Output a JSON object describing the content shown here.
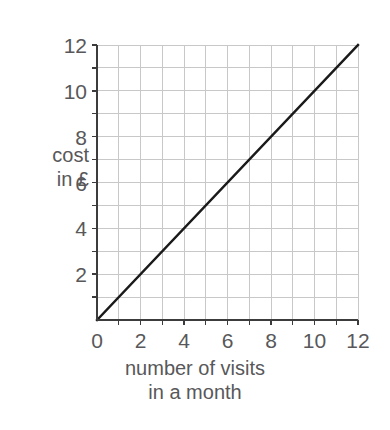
{
  "chart_data": {
    "type": "line",
    "title": "",
    "xlabel": "number of visits\nin a month",
    "ylabel": "cost\nin £",
    "xlim": [
      0,
      12
    ],
    "ylim": [
      0,
      12
    ],
    "grid": true,
    "grid_step": 1,
    "legend": "none",
    "x_tick_labels": [
      "0",
      "2",
      "4",
      "6",
      "8",
      "10",
      "12"
    ],
    "x_tick_values": [
      0,
      2,
      4,
      6,
      8,
      10,
      12
    ],
    "y_tick_labels": [
      "2",
      "4",
      "6",
      "8",
      "10",
      "12"
    ],
    "y_tick_values": [
      2,
      4,
      6,
      8,
      10,
      12
    ],
    "series": [
      {
        "name": "cost",
        "x": [
          0,
          12
        ],
        "values": [
          0,
          12
        ],
        "points": [
          [
            0,
            0
          ],
          [
            1,
            1
          ],
          [
            2,
            2
          ],
          [
            3,
            3
          ],
          [
            4,
            4
          ],
          [
            5,
            5
          ],
          [
            6,
            6
          ],
          [
            7,
            7
          ],
          [
            8,
            8
          ],
          [
            9,
            9
          ],
          [
            10,
            10
          ],
          [
            11,
            11
          ],
          [
            12,
            12
          ]
        ],
        "relation": "y = x",
        "color": "#1a1a1a"
      }
    ]
  },
  "colors": {
    "background": "#ffffff",
    "axis": "#3c3c3c",
    "grid": "#c8c8c8",
    "text": "#58585a",
    "line": "#1a1a1a"
  }
}
